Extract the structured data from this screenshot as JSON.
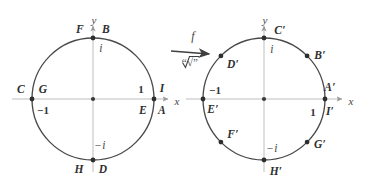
{
  "figure": {
    "map": {
      "function_label": "f",
      "operation_label": "“√”",
      "arrow_icon": "right-arrow-icon"
    },
    "axes": {
      "x_label": "x",
      "y_label": "y"
    },
    "left_circle": {
      "name": "domain-unit-circle",
      "center": [
        93,
        99
      ],
      "radius": 61,
      "axis_values": {
        "right": "1",
        "left": "−1",
        "top": "i",
        "bottom": "−i"
      },
      "points": [
        {
          "id": "B",
          "label": "B",
          "angle": 90,
          "pos": "top-right-of-point"
        },
        {
          "id": "F",
          "label": "F",
          "angle": 90,
          "pos": "top-left-of-point"
        },
        {
          "id": "A",
          "label": "A",
          "angle": 0,
          "pos": "below-right-of-point"
        },
        {
          "id": "I",
          "label": "I",
          "angle": 0,
          "pos": "above-right-of-point"
        },
        {
          "id": "E",
          "label": "E",
          "angle": 0,
          "pos": "below-left-of-point"
        },
        {
          "id": "C",
          "label": "C",
          "angle": 180,
          "pos": "left-outside-of-point"
        },
        {
          "id": "G",
          "label": "G",
          "angle": 180,
          "pos": "right-inside-of-point"
        },
        {
          "id": "D",
          "label": "D",
          "angle": 270,
          "pos": "below-right-of-point"
        },
        {
          "id": "H",
          "label": "H",
          "angle": 270,
          "pos": "below-left-of-point"
        }
      ]
    },
    "right_circle": {
      "name": "image-unit-circle",
      "center": [
        264,
        99
      ],
      "radius": 61,
      "axis_values": {
        "right": "1",
        "left": "−1",
        "top": "i",
        "bottom": "−i"
      },
      "points": [
        {
          "id": "Cp",
          "label": "C′",
          "angle": 90,
          "pos": "right-of-top-point"
        },
        {
          "id": "Bp",
          "label": "B′",
          "angle": 45,
          "pos": "outside-upper-right"
        },
        {
          "id": "Dp",
          "label": "D′",
          "angle": 135,
          "pos": "inside-upper-left"
        },
        {
          "id": "Ap",
          "label": "A′",
          "angle": 0,
          "pos": "above-right-of-point"
        },
        {
          "id": "Ip",
          "label": "I′",
          "angle": 0,
          "pos": "below-right-of-point"
        },
        {
          "id": "Ep",
          "label": "E′",
          "angle": 180,
          "pos": "below-of-left-point"
        },
        {
          "id": "Fp",
          "label": "F′",
          "angle": 225,
          "pos": "inside-lower-left"
        },
        {
          "id": "Gp",
          "label": "G′",
          "angle": 270,
          "pos": "below-bottom-point"
        },
        {
          "id": "Hp",
          "label": "H′",
          "angle": 315,
          "pos": "inside-lower-right"
        }
      ]
    },
    "colors": {
      "stroke": "#4a4a4a",
      "axis": "#b9b9b9",
      "text": "#444444",
      "background": "#ffffff"
    }
  }
}
